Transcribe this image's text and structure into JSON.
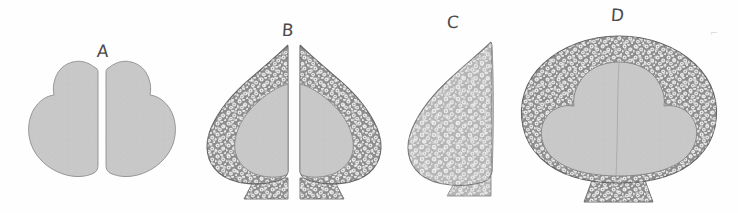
{
  "figure": {
    "title": "",
    "background_color": "#fefefe",
    "width": 738,
    "height": 213,
    "style": "hand-drawn scientific line illustration, grayscale"
  },
  "palette": {
    "outline": "#5a5a5a",
    "plain_tissue_fill": "#c8c8c8",
    "dark_cortex_fill": "#8f8f8f",
    "dark_cortex_cell": "#ececec",
    "light_cortex_fill": "#b4b4b4",
    "light_cortex_cell": "#f2f2f2",
    "midline": "#a8a8a8",
    "label_color": "#4a4a4a",
    "artifact_color": "#d8d8d8"
  },
  "panels": [
    {
      "id": "panel-a",
      "label": "A",
      "label_x": 97,
      "label_y": 50,
      "description": "Two mirrored smooth cotyledon-like halves, uniform light gray, no cellular texture",
      "texture": "none",
      "halves": 2,
      "has_stalk": false,
      "has_midline": false
    },
    {
      "id": "panel-b",
      "label": "B",
      "label_x": 284,
      "label_y": 29,
      "description": "Two mirrored teardrop halves with dark speckled cellular cortex and light inner mass, each on a flared stalk",
      "texture": "dark-cellular",
      "halves": 2,
      "has_stalk": true,
      "has_midline": false
    },
    {
      "id": "panel-c",
      "label": "C",
      "label_x": 450,
      "label_y": 21,
      "description": "Single leaf-shaped body entirely filled with light speckled cellular texture, on a short stalk",
      "texture": "light-cellular",
      "halves": 1,
      "has_stalk": true,
      "has_midline": false
    },
    {
      "id": "panel-d",
      "label": "D",
      "label_x": 611,
      "label_y": 14,
      "description": "Rounded fan-shaped body with dark speckled cellular cortex, large light interior with faint vertical midline, on a single flared stalk",
      "texture": "dark-cellular",
      "halves": 1,
      "has_stalk": true,
      "has_midline": true
    }
  ],
  "artifact": {
    "name": "stray-ink-mark",
    "x": 713,
    "y": 34,
    "glyph": "⌐"
  }
}
